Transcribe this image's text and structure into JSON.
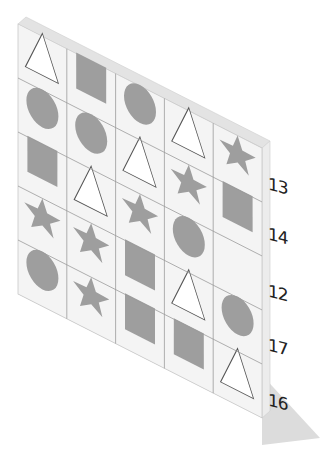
{
  "puzzle": {
    "columns": 5,
    "rows": 5,
    "colors": {
      "board_face": "#f4f4f4",
      "board_edge": "#e2e2e2",
      "board_side": "#ebebeb",
      "grid_line": "#9a9a9a",
      "shape_fill": "#9e9e9e",
      "triangle_stroke": "#555555",
      "shadow": "#dcdcdc"
    },
    "grid": [
      [
        "triangle",
        "square",
        "circle",
        "triangle",
        "star"
      ],
      [
        "circle",
        "circle",
        "triangle",
        "star",
        "square"
      ],
      [
        "square",
        "triangle",
        "star",
        "circle",
        "empty"
      ],
      [
        "star",
        "star",
        "square",
        "triangle",
        "circle"
      ],
      [
        "circle",
        "star",
        "square",
        "square",
        "triangle"
      ]
    ],
    "row_sums": [
      "13",
      "14",
      "12",
      "17",
      "16"
    ]
  }
}
